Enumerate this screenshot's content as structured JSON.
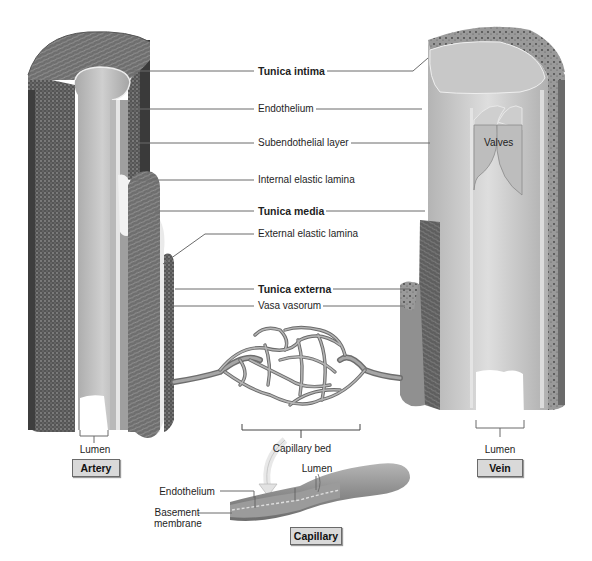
{
  "diagram": {
    "colors": {
      "background": "#ffffff",
      "leader_line": "#6b6b6b",
      "label_box_fill": "#d9d9d9",
      "label_box_border": "#6a6a6a",
      "tissue_dark": "#4a4a4a",
      "tissue_mid": "#8c8c8c",
      "tissue_light": "#c4c4c4",
      "lumen_surface": "#b8b8b8"
    },
    "center_labels": [
      {
        "id": "tunica-intima",
        "text": "Tunica intima",
        "bold": true
      },
      {
        "id": "endothelium",
        "text": "Endothelium",
        "bold": false
      },
      {
        "id": "subendothelial-layer",
        "text": "Subendothelial layer",
        "bold": false
      },
      {
        "id": "internal-elastic-lamina",
        "text": "Internal elastic lamina",
        "bold": false
      },
      {
        "id": "tunica-media",
        "text": "Tunica media",
        "bold": true
      },
      {
        "id": "external-elastic-lamina",
        "text": "External elastic lamina",
        "bold": false
      },
      {
        "id": "tunica-externa",
        "text": "Tunica externa",
        "bold": true
      },
      {
        "id": "vasa-vasorum",
        "text": "Vasa vasorum",
        "bold": false
      }
    ],
    "artery": {
      "lumen_label": "Lumen",
      "title": "Artery"
    },
    "vein": {
      "lumen_label": "Lumen",
      "title": "Vein",
      "valves_label": "Valves"
    },
    "capillary_bed": {
      "label": "Capillary bed"
    },
    "capillary": {
      "title": "Capillary",
      "lumen_label": "Lumen",
      "endothelium_label": "Endothelium",
      "basement_membrane_label": "Basement membrane",
      "basement_membrane_line1": "Basement",
      "basement_membrane_line2": "membrane"
    }
  }
}
